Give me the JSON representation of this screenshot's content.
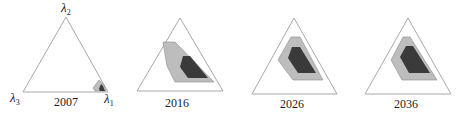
{
  "figure": {
    "colors": {
      "background": "#ffffff",
      "triangle_stroke": "#a8a8a8",
      "outer_region_fill": "#bdbdbd",
      "outer_region_stroke": "#8c8c8c",
      "inner_region_fill": "#3a3a3a"
    },
    "vertex_labels": {
      "top": "λ2",
      "left": "λ3",
      "right": "λ1"
    },
    "panels": [
      {
        "year": "2007",
        "triangle": [
          [
            66,
            17
          ],
          [
            23,
            92
          ],
          [
            108,
            92
          ]
        ],
        "outer_region": [
          [
            99,
            80
          ],
          [
            93,
            88
          ],
          [
            95,
            91
          ],
          [
            106,
            91
          ],
          [
            104,
            85
          ]
        ],
        "inner_region": [
          [
            101,
            84
          ],
          [
            99,
            89
          ],
          [
            100,
            91
          ],
          [
            105,
            91
          ],
          [
            103,
            86
          ]
        ],
        "year_pos": [
          66,
          106
        ],
        "show_vertex_labels": true
      },
      {
        "year": "2016",
        "triangle": [
          [
            180,
            18
          ],
          [
            137,
            91
          ],
          [
            223,
            91
          ]
        ],
        "outer_region": [
          [
            163,
            42
          ],
          [
            175,
            42
          ],
          [
            214,
            82
          ],
          [
            175,
            82
          ],
          [
            167,
            66
          ]
        ],
        "inner_region": [
          [
            183,
            56
          ],
          [
            190,
            56
          ],
          [
            208,
            78
          ],
          [
            188,
            78
          ],
          [
            180,
            67
          ]
        ],
        "year_pos": [
          177,
          107
        ],
        "show_vertex_labels": false
      },
      {
        "year": "2026",
        "triangle": [
          [
            294,
            18
          ],
          [
            252,
            94
          ],
          [
            337,
            94
          ]
        ],
        "outer_region": [
          [
            291,
            37
          ],
          [
            300,
            37
          ],
          [
            323,
            80
          ],
          [
            293,
            80
          ],
          [
            278,
            60
          ]
        ],
        "inner_region": [
          [
            292,
            47
          ],
          [
            300,
            47
          ],
          [
            316,
            73
          ],
          [
            298,
            73
          ],
          [
            288,
            58
          ]
        ],
        "year_pos": [
          292,
          108
        ],
        "show_vertex_labels": false
      },
      {
        "year": "2036",
        "triangle": [
          [
            408,
            18
          ],
          [
            365,
            94
          ],
          [
            451,
            94
          ]
        ],
        "outer_region": [
          [
            403,
            37
          ],
          [
            410,
            37
          ],
          [
            437,
            80
          ],
          [
            402,
            80
          ],
          [
            391,
            60
          ]
        ],
        "inner_region": [
          [
            406,
            46
          ],
          [
            413,
            46
          ],
          [
            430,
            73
          ],
          [
            409,
            73
          ],
          [
            400,
            57
          ]
        ],
        "year_pos": [
          406,
          108
        ],
        "show_vertex_labels": false
      }
    ]
  }
}
